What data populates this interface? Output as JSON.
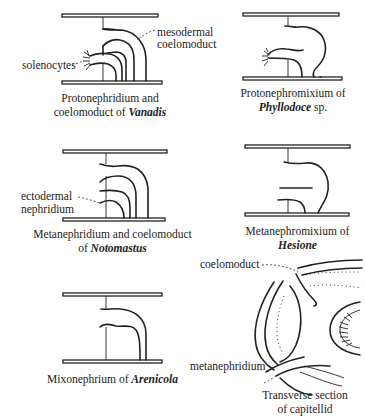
{
  "figure": {
    "panels": [
      {
        "id": "vanadis",
        "caption_line1": "Protonephridium and",
        "caption_line2_prefix": "coelomoduct of ",
        "caption_genus": "Vanadis",
        "labels": [
          "solenocytes",
          "mesodermal",
          "coelomoduct"
        ]
      },
      {
        "id": "phyllodoce",
        "caption_line1": "Protonephromixium of",
        "caption_genus": "Phyllodoce",
        "caption_suffix": " sp."
      },
      {
        "id": "notomastus",
        "caption_line1": "Metanephridium and coelomoduct",
        "caption_line2_prefix": "of ",
        "caption_genus": "Notomastus",
        "labels": [
          "ectodermal",
          "nephridium"
        ]
      },
      {
        "id": "hesione",
        "caption_line1": "Metanephromixium of",
        "caption_genus": "Hesione"
      },
      {
        "id": "arenicola",
        "caption_line1_prefix": "Mixonephrium of ",
        "caption_genus": "Arenicola"
      },
      {
        "id": "capitellid",
        "caption_line1": "Transverse section",
        "caption_line2": "of capitellid",
        "labels": [
          "coelomoduct",
          "metanephridium"
        ]
      }
    ]
  }
}
